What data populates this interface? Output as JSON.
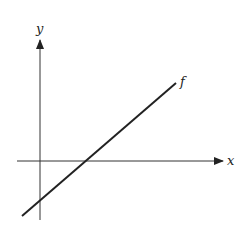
{
  "diagram": {
    "title": "",
    "axes": {
      "x_label": "x",
      "y_label": "y"
    },
    "curves": [
      {
        "label": "f",
        "type": "line",
        "description": "increasing straight line crossing x-axis to the right of origin, negative y-intercept"
      }
    ],
    "colors": {
      "stroke": "#222222",
      "background": "#ffffff"
    }
  }
}
